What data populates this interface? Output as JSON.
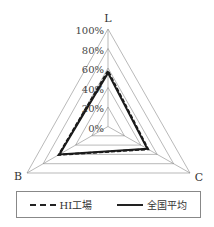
{
  "chart_data": {
    "type": "radar",
    "title": "",
    "axes": [
      "L",
      "B",
      "C"
    ],
    "ticks": [
      "0%",
      "20%",
      "40%",
      "60%",
      "80%",
      "100%"
    ],
    "range": [
      0,
      100
    ],
    "grid": true,
    "legend_position": "bottom",
    "series": [
      {
        "name": "HI工場",
        "style": "dashed",
        "values": [
          57,
          61,
          49
        ]
      },
      {
        "name": "全国平均",
        "style": "solid",
        "values": [
          55,
          60,
          48
        ]
      }
    ]
  },
  "legend": {
    "items": [
      {
        "label": "HI工場",
        "style": "dashed"
      },
      {
        "label": "全国平均",
        "style": "solid"
      }
    ]
  },
  "colors": {
    "grid": "#8a8a8a",
    "series": "#1a1a1a"
  }
}
